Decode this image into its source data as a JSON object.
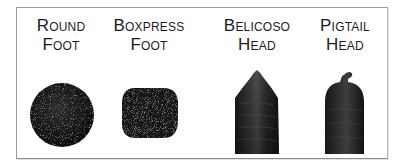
{
  "figure": {
    "items": [
      {
        "id": "round-foot",
        "line1": "Round",
        "line2": "Foot",
        "shape": "circle"
      },
      {
        "id": "boxpress-foot",
        "line1": "Boxpress",
        "line2": "Foot",
        "shape": "rounded-square"
      },
      {
        "id": "belicoso-head",
        "line1": "Belicoso",
        "line2": "Head",
        "shape": "pointed-cigar"
      },
      {
        "id": "pigtail-head",
        "line1": "Pigtail",
        "line2": "Head",
        "shape": "rounded-cigar-with-twist"
      }
    ],
    "colors": {
      "tobacco_dark": "#121212",
      "tobacco_mid": "#3a3a3a",
      "tobacco_highlight": "#6a6a6a",
      "frame_border": "#9a9a9a",
      "text": "#1c1c1c"
    }
  }
}
